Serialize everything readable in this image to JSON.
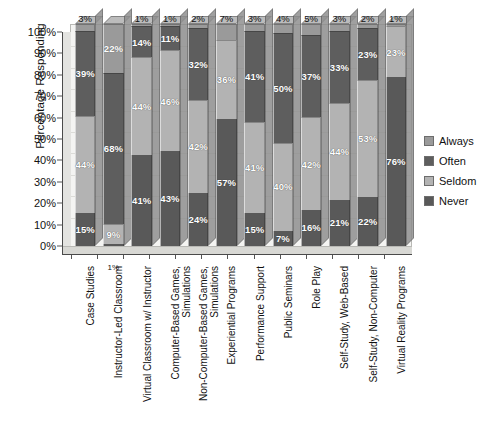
{
  "chart_data": {
    "type": "bar",
    "subtype": "stacked-percentage-3d",
    "title": "",
    "xlabel": "",
    "ylabel": "Percentage Responding",
    "ylim": [
      0,
      100
    ],
    "ytick_labels": [
      "0%",
      "10%",
      "20%",
      "30%",
      "40%",
      "50%",
      "60%",
      "70%",
      "80%",
      "90%",
      "100%"
    ],
    "ytick_values": [
      0,
      10,
      20,
      30,
      40,
      50,
      60,
      70,
      80,
      90,
      100
    ],
    "grid": true,
    "legend_position": "right",
    "stack_order_bottom_to_top": [
      "Never",
      "Seldom",
      "Often",
      "Always"
    ],
    "categories": [
      "Case Studies",
      "Instructor-Led Classroom",
      "Virtual Classroom w/ Instructor",
      "Computer-Based Games, Simulations",
      "Non-Computer-Based Games, Simulations",
      "Experiential Programs",
      "Performance Support",
      "Public Seminars",
      "Role Play",
      "Self-Study, Web-Based",
      "Self-Study, Non-Computer",
      "Virtual Reality Programs"
    ],
    "series": [
      {
        "name": "Never",
        "color": "#595959",
        "values": [
          15,
          1,
          41,
          43,
          24,
          57,
          15,
          7,
          16,
          21,
          22,
          76
        ]
      },
      {
        "name": "Seldom",
        "color": "#b3b3b3",
        "values": [
          44,
          9,
          44,
          46,
          42,
          36,
          41,
          40,
          42,
          44,
          53,
          23
        ]
      },
      {
        "name": "Often",
        "color": "#5e5e5e",
        "values": [
          39,
          68,
          14,
          11,
          32,
          0,
          41,
          50,
          37,
          33,
          23,
          0
        ]
      },
      {
        "name": "Always",
        "color": "#9a9a9a",
        "values": [
          3,
          22,
          1,
          1,
          2,
          7,
          3,
          4,
          5,
          3,
          2,
          1
        ]
      }
    ],
    "inside_labels": {
      "Never": [
        "15%",
        "",
        "41%",
        "43%",
        "24%",
        "57%",
        "15%",
        "7%",
        "16%",
        "21%",
        "22%",
        "76%"
      ],
      "Seldom": [
        "44%",
        "9%",
        "44%",
        "46%",
        "42%",
        "36%",
        "41%",
        "40%",
        "42%",
        "44%",
        "53%",
        "23%"
      ],
      "Often": [
        "39%",
        "68%",
        "14%",
        "11%",
        "32%",
        "",
        "41%",
        "50%",
        "37%",
        "33%",
        "23%",
        ""
      ],
      "Always": [
        "",
        "22%",
        "",
        "",
        "",
        "",
        "",
        "",
        "",
        "",
        "",
        ""
      ]
    },
    "top_callout_labels": [
      "3%",
      "",
      "1%",
      "1%",
      "2%",
      "7%",
      "3%",
      "4%",
      "5%",
      "3%",
      "2%",
      "1%"
    ],
    "bottom_callout_labels": [
      "",
      "1%",
      "",
      "",
      "",
      "",
      "",
      "",
      "",
      "",
      "",
      ""
    ]
  },
  "legend": {
    "items": [
      {
        "label": "Always",
        "color": "#9a9a9a"
      },
      {
        "label": "Often",
        "color": "#5e5e5e"
      },
      {
        "label": "Seldom",
        "color": "#b3b3b3"
      },
      {
        "label": "Never",
        "color": "#595959"
      }
    ]
  },
  "colors": {
    "always": "#9a9a9a",
    "often": "#5e5e5e",
    "seldom": "#b3b3b3",
    "never": "#595959",
    "plot_background": "#f4f4f2",
    "gridline": "#dcdcd8",
    "axis": "#4a4a4a",
    "text": "#111111"
  }
}
